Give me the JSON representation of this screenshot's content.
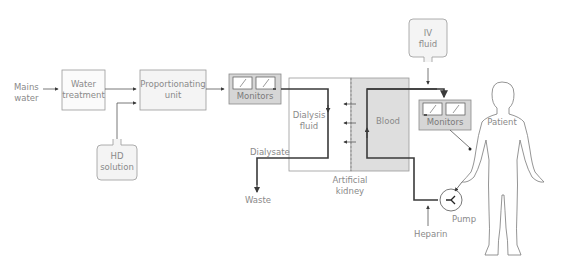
{
  "diagram": {
    "nodes": {
      "mains_water": "Mains water",
      "mains_water_l1": "Mains",
      "mains_water_l2": "water",
      "water_treatment_l1": "Water",
      "water_treatment_l2": "treatment",
      "proportionating_l1": "Proportionating",
      "proportionating_l2": "unit",
      "hd_solution_l1": "HD",
      "hd_solution_l2": "solution",
      "monitors_dialysate": "Monitors",
      "dialysis_fluid_l1": "Dialysis",
      "dialysis_fluid_l2": "fluid",
      "blood": "Blood",
      "dialysate": "Dialysate",
      "waste": "Waste",
      "artificial_kidney_l1": "Artificial",
      "artificial_kidney_l2": "kidney",
      "iv_fluid_l1": "IV",
      "iv_fluid_l2": "fluid",
      "monitors_blood": "Monitors",
      "patient": "Patient",
      "pump": "Pump",
      "heparin": "Heparin"
    },
    "colors": {
      "line": "#3a3a3a",
      "box_border": "#9a9a9a",
      "box_fill_light": "#f4f4f4",
      "box_fill_grey": "#d6d6d6",
      "blood_fill": "#dedede",
      "text": "#8a8a8a"
    }
  }
}
